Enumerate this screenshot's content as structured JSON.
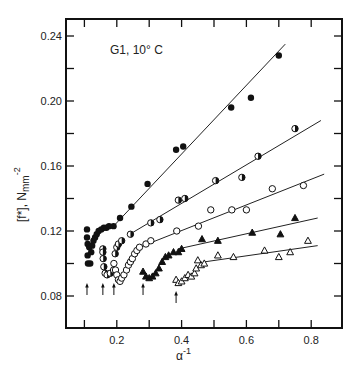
{
  "chart_data": {
    "type": "scatter",
    "title": "G1, 10° C",
    "xlabel": "α⁻¹",
    "ylabel": "[f*], N mm⁻²",
    "xlim": [
      0.043,
      0.895
    ],
    "ylim": [
      0.06,
      0.25
    ],
    "xticks": [
      0.1,
      0.2,
      0.3,
      0.4,
      0.5,
      0.6,
      0.7,
      0.8
    ],
    "xtick_labels": [
      "0.2",
      "0.4",
      "0.6",
      "0.8"
    ],
    "xtick_label_values": [
      0.2,
      0.4,
      0.6,
      0.8
    ],
    "yticks": [
      0.08,
      0.1,
      0.12,
      0.14,
      0.16,
      0.18,
      0.2,
      0.22,
      0.24
    ],
    "ytick_labels": [
      "0.08",
      "0.12",
      "0.16",
      "0.20",
      "0.24"
    ],
    "ytick_label_values": [
      0.08,
      0.12,
      0.16,
      0.2,
      0.24
    ],
    "grid": false,
    "legend": null,
    "arrows_x": [
      0.108,
      0.157,
      0.191,
      0.281,
      0.383
    ],
    "series": [
      {
        "name": "filled circles",
        "marker": "filled-circle",
        "points": [
          [
            0.108,
            0.121
          ],
          [
            0.108,
            0.116
          ],
          [
            0.11,
            0.112
          ],
          [
            0.11,
            0.105
          ],
          [
            0.111,
            0.1
          ],
          [
            0.115,
            0.11
          ],
          [
            0.118,
            0.1
          ],
          [
            0.121,
            0.107
          ],
          [
            0.124,
            0.111
          ],
          [
            0.128,
            0.114
          ],
          [
            0.133,
            0.116
          ],
          [
            0.138,
            0.118
          ],
          [
            0.144,
            0.12
          ],
          [
            0.152,
            0.121
          ],
          [
            0.16,
            0.122
          ],
          [
            0.168,
            0.122
          ],
          [
            0.176,
            0.123
          ],
          [
            0.19,
            0.123
          ],
          [
            0.21,
            0.128
          ],
          [
            0.245,
            0.135
          ],
          [
            0.295,
            0.149
          ],
          [
            0.383,
            0.17
          ],
          [
            0.405,
            0.172
          ],
          [
            0.553,
            0.196
          ],
          [
            0.614,
            0.202
          ],
          [
            0.7,
            0.228
          ]
        ],
        "fit_line": [
          [
            0.19,
            0.123
          ],
          [
            0.72,
            0.235
          ]
        ]
      },
      {
        "name": "half-filled circles",
        "marker": "half-filled-circle",
        "points": [
          [
            0.157,
            0.109
          ],
          [
            0.157,
            0.107
          ],
          [
            0.158,
            0.103
          ],
          [
            0.16,
            0.098
          ],
          [
            0.164,
            0.094
          ],
          [
            0.17,
            0.093
          ],
          [
            0.18,
            0.094
          ],
          [
            0.19,
            0.096
          ],
          [
            0.195,
            0.106
          ],
          [
            0.2,
            0.11
          ],
          [
            0.205,
            0.112
          ],
          [
            0.215,
            0.114
          ],
          [
            0.242,
            0.118
          ],
          [
            0.305,
            0.125
          ],
          [
            0.333,
            0.127
          ],
          [
            0.39,
            0.139
          ],
          [
            0.41,
            0.14
          ],
          [
            0.505,
            0.151
          ],
          [
            0.586,
            0.153
          ],
          [
            0.636,
            0.166
          ],
          [
            0.75,
            0.183
          ]
        ],
        "fit_line": [
          [
            0.24,
            0.118
          ],
          [
            0.83,
            0.188
          ]
        ]
      },
      {
        "name": "open circles",
        "marker": "open-circle",
        "points": [
          [
            0.191,
            0.1
          ],
          [
            0.196,
            0.096
          ],
          [
            0.2,
            0.093
          ],
          [
            0.205,
            0.09
          ],
          [
            0.21,
            0.089
          ],
          [
            0.215,
            0.091
          ],
          [
            0.222,
            0.093
          ],
          [
            0.23,
            0.096
          ],
          [
            0.236,
            0.099
          ],
          [
            0.242,
            0.101
          ],
          [
            0.248,
            0.103
          ],
          [
            0.255,
            0.106
          ],
          [
            0.262,
            0.108
          ],
          [
            0.27,
            0.11
          ],
          [
            0.29,
            0.112
          ],
          [
            0.305,
            0.114
          ],
          [
            0.385,
            0.12
          ],
          [
            0.452,
            0.123
          ],
          [
            0.49,
            0.133
          ],
          [
            0.555,
            0.133
          ],
          [
            0.6,
            0.133
          ],
          [
            0.68,
            0.146
          ],
          [
            0.776,
            0.148
          ]
        ],
        "fit_line": [
          [
            0.27,
            0.11
          ],
          [
            0.84,
            0.155
          ]
        ]
      },
      {
        "name": "filled triangles",
        "marker": "filled-triangle",
        "points": [
          [
            0.281,
            0.095
          ],
          [
            0.29,
            0.092
          ],
          [
            0.3,
            0.091
          ],
          [
            0.31,
            0.092
          ],
          [
            0.32,
            0.094
          ],
          [
            0.33,
            0.097
          ],
          [
            0.34,
            0.101
          ],
          [
            0.35,
            0.104
          ],
          [
            0.36,
            0.105
          ],
          [
            0.375,
            0.107
          ],
          [
            0.39,
            0.107
          ],
          [
            0.4,
            0.109
          ],
          [
            0.463,
            0.115
          ],
          [
            0.512,
            0.114
          ],
          [
            0.618,
            0.119
          ],
          [
            0.705,
            0.118
          ],
          [
            0.75,
            0.128
          ]
        ],
        "fit_line": [
          [
            0.39,
            0.109
          ],
          [
            0.82,
            0.128
          ]
        ]
      },
      {
        "name": "open triangles",
        "marker": "open-triangle",
        "points": [
          [
            0.383,
            0.09
          ],
          [
            0.39,
            0.088
          ],
          [
            0.4,
            0.089
          ],
          [
            0.41,
            0.091
          ],
          [
            0.42,
            0.093
          ],
          [
            0.43,
            0.092
          ],
          [
            0.44,
            0.094
          ],
          [
            0.445,
            0.097
          ],
          [
            0.45,
            0.102
          ],
          [
            0.46,
            0.099
          ],
          [
            0.47,
            0.1
          ],
          [
            0.512,
            0.105
          ],
          [
            0.56,
            0.104
          ],
          [
            0.656,
            0.108
          ],
          [
            0.7,
            0.104
          ],
          [
            0.735,
            0.107
          ],
          [
            0.79,
            0.114
          ]
        ],
        "fit_line": [
          [
            0.47,
            0.101
          ],
          [
            0.82,
            0.111
          ]
        ]
      }
    ]
  },
  "annotation": "G1, 10° C",
  "axes": {
    "x_title_main": "α",
    "x_title_sup": "-1",
    "y_title_main": "[f*], N",
    "y_title_sub": "mm",
    "y_title_sup": "-2"
  }
}
